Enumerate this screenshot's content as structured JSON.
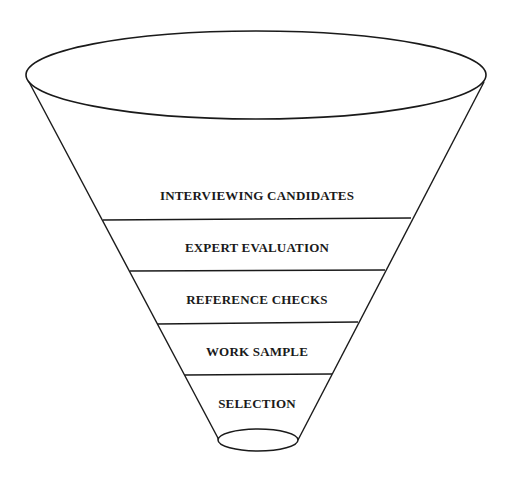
{
  "diagram": {
    "type": "funnel",
    "stroke_color": "#1a1a1a",
    "background": "#ffffff",
    "stages": [
      {
        "label": "INTERVIEWING CANDIDATES"
      },
      {
        "label": "EXPERT EVALUATION"
      },
      {
        "label": "REFERENCE CHECKS"
      },
      {
        "label": "WORK SAMPLE"
      },
      {
        "label": "SELECTION"
      }
    ]
  }
}
